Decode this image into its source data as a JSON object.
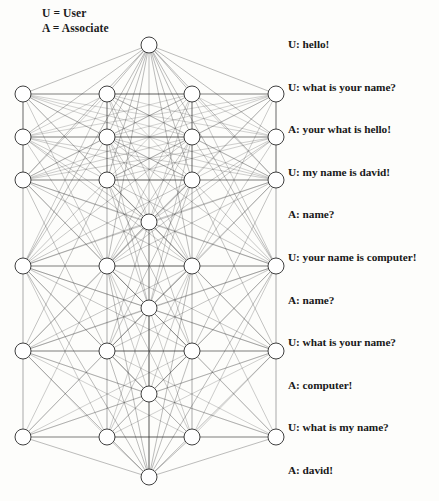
{
  "legend": {
    "lines": [
      "U = User",
      "A = Associate"
    ]
  },
  "transcript": {
    "lines": [
      "U: hello!",
      "U: what is your name?",
      "A: your what is hello!",
      "U: my name is david!",
      "A: name?",
      "U: your name is computer!",
      "A: name?",
      "U: what is your name?",
      "A: computer!",
      "U: what is my name?",
      "A: david!"
    ]
  },
  "diagram": {
    "type": "neural-network-graph",
    "node_radius": 8,
    "node_fill": "#ffffff",
    "node_stroke": "#2a2a2a",
    "edge_color": "#3a3a3a",
    "background": "#fdfdfb",
    "apex_top": {
      "x": 149,
      "y": 45
    },
    "apex_bottom": {
      "x": 149,
      "y": 477
    },
    "columns": [
      {
        "name": "column-1",
        "x": 23,
        "rows": [
          94,
          137,
          180,
          266,
          351,
          437
        ]
      },
      {
        "name": "column-2",
        "x": 107,
        "rows": [
          94,
          137,
          180,
          266,
          351,
          437
        ]
      },
      {
        "name": "column-center",
        "x": 149,
        "rows": [
          222,
          308,
          394
        ]
      },
      {
        "name": "column-3",
        "x": 192,
        "rows": [
          94,
          137,
          180,
          266,
          351,
          437
        ]
      },
      {
        "name": "column-4",
        "x": 276,
        "rows": [
          94,
          137,
          180,
          266,
          351,
          437
        ]
      }
    ]
  }
}
